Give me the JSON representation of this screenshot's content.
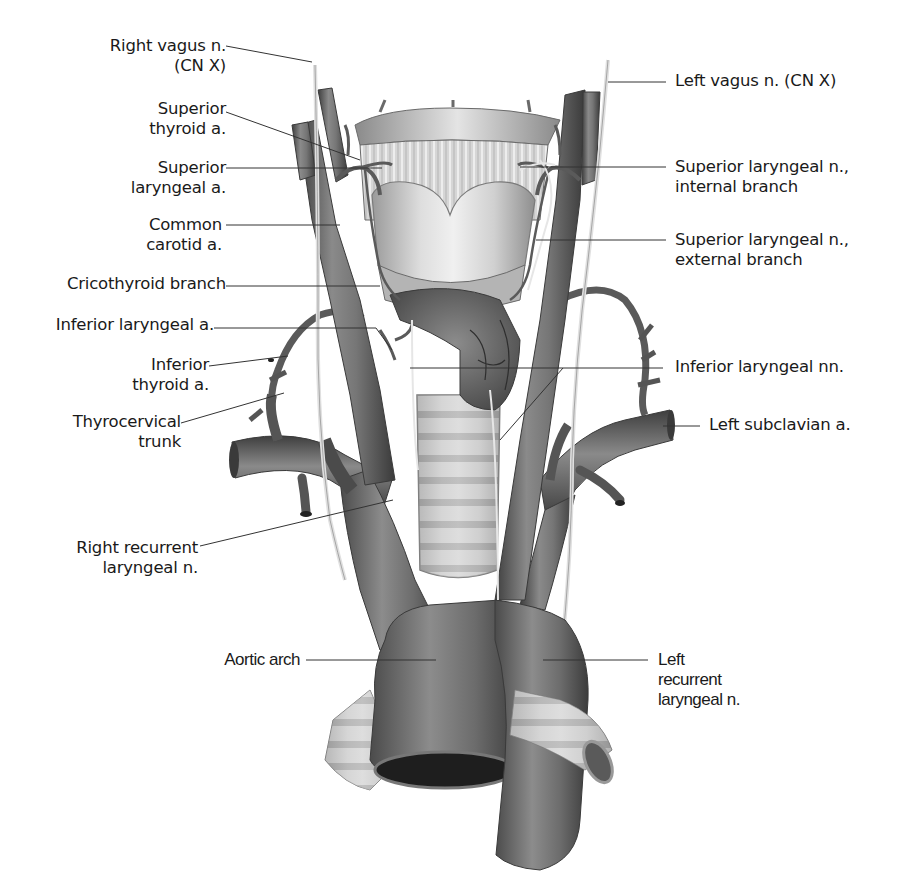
{
  "figure": {
    "colors": {
      "background": "#ffffff",
      "vessel": "#707070",
      "vessel_dark": "#4a4a4a",
      "nerve": "#d8d8d8",
      "cartilage": "#cfcfcf",
      "leader_line": "#333333",
      "text": "#1a1a1a"
    }
  },
  "labels": {
    "left": [
      {
        "id": "right-vagus",
        "lines": [
          "Right vagus n.",
          "(CN X)"
        ]
      },
      {
        "id": "superior-thyroid-a",
        "lines": [
          "Superior",
          "thyroid a."
        ]
      },
      {
        "id": "superior-laryngeal-a",
        "lines": [
          "Superior",
          "laryngeal a."
        ]
      },
      {
        "id": "common-carotid-a",
        "lines": [
          "Common",
          "carotid a."
        ]
      },
      {
        "id": "cricothyroid-branch",
        "lines": [
          "Cricothyroid branch"
        ]
      },
      {
        "id": "inferior-laryngeal-a",
        "lines": [
          "Inferior laryngeal a."
        ]
      },
      {
        "id": "inferior-thyroid-a",
        "lines": [
          "Inferior",
          "thyroid a."
        ]
      },
      {
        "id": "thyrocervical-trunk",
        "lines": [
          "Thyrocervical",
          "trunk"
        ]
      },
      {
        "id": "right-recurrent-laryngeal-n",
        "lines": [
          "Right recurrent",
          "laryngeal n."
        ]
      },
      {
        "id": "aortic-arch",
        "lines": [
          "Aortic arch"
        ]
      }
    ],
    "right": [
      {
        "id": "left-vagus",
        "lines": [
          "Left vagus n. (CN X)"
        ]
      },
      {
        "id": "superior-laryngeal-n-internal",
        "lines": [
          "Superior laryngeal n.,",
          "internal branch"
        ]
      },
      {
        "id": "superior-laryngeal-n-external",
        "lines": [
          "Superior laryngeal n.,",
          "external branch"
        ]
      },
      {
        "id": "inferior-laryngeal-nn",
        "lines": [
          "Inferior laryngeal nn."
        ]
      },
      {
        "id": "left-subclavian-a",
        "lines": [
          "Left subclavian a."
        ]
      },
      {
        "id": "left-recurrent-laryngeal-n",
        "lines": [
          "Left",
          "recurrent",
          "laryngeal n."
        ]
      }
    ]
  }
}
